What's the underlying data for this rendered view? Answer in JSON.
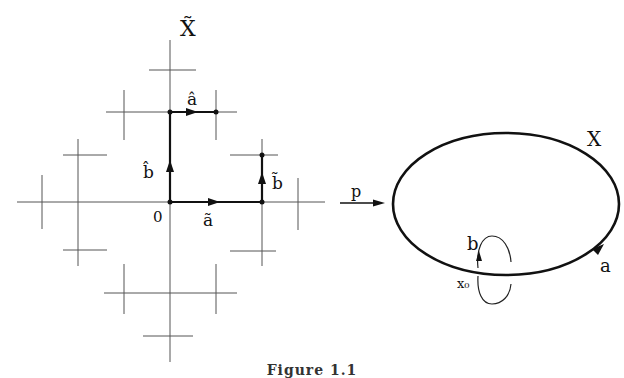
{
  "figure": {
    "caption": "Figure 1.1",
    "left_panel": {
      "title": "X̃",
      "origin_label": "0",
      "labels": {
        "a_hat": "â",
        "b_hat": "b̂",
        "a_tilde": "ã",
        "b_tilde": "b̃"
      }
    },
    "map_label": "p",
    "right_panel": {
      "title": "X",
      "loop_a_label": "a",
      "loop_b_label": "b",
      "basepoint_label": "x₀"
    },
    "colors": {
      "ink": "#111111",
      "grid": "#555555",
      "background": "#ffffff"
    }
  }
}
